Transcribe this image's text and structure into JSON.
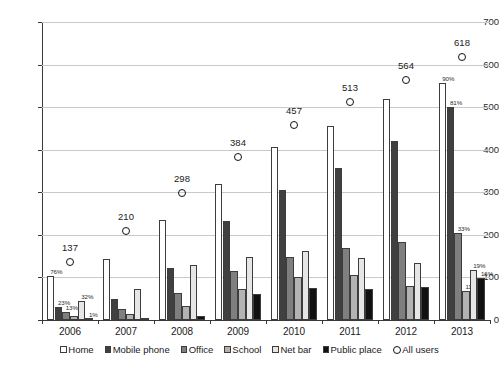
{
  "chart_data": {
    "type": "bar",
    "title": "",
    "subtitle": "",
    "xlabel": "",
    "ylabel": "",
    "categories": [
      "2006",
      "2007",
      "2008",
      "2009",
      "2010",
      "2011",
      "2012",
      "2013"
    ],
    "ylim": [
      0,
      700
    ],
    "ytick_step": 100,
    "ytick_labels": [
      "0",
      "100",
      "200",
      "300",
      "400",
      "500",
      "600",
      "700"
    ],
    "grid": true,
    "legend_position": "bottom",
    "series": [
      {
        "name": "Home",
        "color": "#ffffff",
        "type": "bar",
        "values": [
          104,
          143,
          235,
          320,
          407,
          456,
          518,
          556
        ],
        "point_labels": [
          "76%",
          "",
          "",
          "",
          "",
          "",
          "",
          "90%"
        ]
      },
      {
        "name": "Mobile phone",
        "color": "#404040",
        "type": "bar",
        "values": [
          31,
          50,
          123,
          233,
          305,
          356,
          420,
          500
        ],
        "point_labels": [
          "23%",
          "",
          "",
          "",
          "",
          "",
          "",
          "81%"
        ]
      },
      {
        "name": "Office",
        "color": "#7f7f7f",
        "type": "bar",
        "values": [
          18,
          27,
          63,
          114,
          148,
          170,
          183,
          204
        ],
        "point_labels": [
          "13%",
          "",
          "",
          "",
          "",
          "",
          "",
          "33%"
        ]
      },
      {
        "name": "School",
        "color": "#b3b3b3",
        "type": "bar",
        "values": [
          9,
          14,
          33,
          73,
          102,
          106,
          81,
          68
        ],
        "point_labels": [
          "",
          "",
          "",
          "",
          "",
          "",
          "",
          "11%"
        ]
      },
      {
        "name": "Net bar",
        "color": "#e6e6e6",
        "type": "bar",
        "values": [
          44,
          73,
          130,
          149,
          163,
          146,
          133,
          117
        ],
        "point_labels": [
          "32%",
          "",
          "",
          "",
          "",
          "",
          "",
          "19%"
        ]
      },
      {
        "name": "Public place",
        "color": "#111111",
        "type": "bar",
        "values": [
          1,
          3,
          9,
          62,
          76,
          72,
          77,
          99
        ],
        "point_labels": [
          "1%",
          "",
          "",
          "",
          "",
          "",
          "",
          "16%"
        ]
      },
      {
        "name": "All users",
        "color": "#ffffff",
        "type": "scatter",
        "marker": "open-circle",
        "values": [
          137,
          210,
          298,
          384,
          457,
          513,
          564,
          618
        ],
        "point_labels": [
          "137",
          "210",
          "298",
          "384",
          "457",
          "513",
          "564",
          "618"
        ]
      }
    ]
  },
  "legend": {
    "items": [
      {
        "label": "Home",
        "marker": "square"
      },
      {
        "label": "Mobile phone",
        "marker": "square"
      },
      {
        "label": "Office",
        "marker": "square"
      },
      {
        "label": "School",
        "marker": "square"
      },
      {
        "label": "Net bar",
        "marker": "square"
      },
      {
        "label": "Public place",
        "marker": "square"
      },
      {
        "label": "All users",
        "marker": "circle"
      }
    ]
  }
}
